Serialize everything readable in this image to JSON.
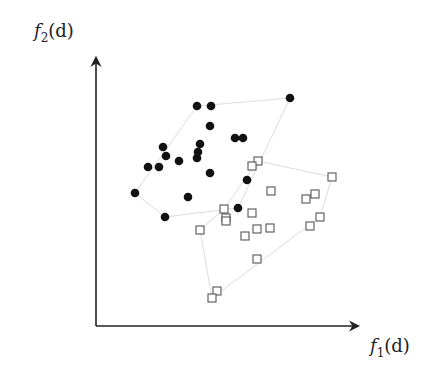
{
  "chart_data": {
    "type": "scatter",
    "title": "",
    "xlabel": "f_1(d)",
    "ylabel": "f_2(d)",
    "axes": {
      "ticks": false,
      "grid": false,
      "arrows": true
    },
    "series": [
      {
        "name": "class A",
        "marker": "filled-circle",
        "color": "#111111",
        "points": [
          [
            197,
            106
          ],
          [
            211,
            106
          ],
          [
            290,
            98
          ],
          [
            210,
            126
          ],
          [
            235,
            138
          ],
          [
            243,
            138
          ],
          [
            163,
            147
          ],
          [
            200,
            144
          ],
          [
            198,
            152
          ],
          [
            197,
            158
          ],
          [
            166,
            156
          ],
          [
            179,
            161
          ],
          [
            148,
            167
          ],
          [
            159,
            167
          ],
          [
            210,
            173
          ],
          [
            247,
            180
          ],
          [
            135,
            193
          ],
          [
            188,
            197
          ],
          [
            165,
            217
          ],
          [
            238,
            208
          ]
        ],
        "hull": [
          [
            135,
            193
          ],
          [
            197,
            106
          ],
          [
            290,
            98
          ],
          [
            238,
            208
          ],
          [
            165,
            217
          ]
        ]
      },
      {
        "name": "class B",
        "marker": "open-square",
        "color": "#555555",
        "points": [
          [
            258,
            161
          ],
          [
            252,
            166
          ],
          [
            271,
            191
          ],
          [
            332,
            177
          ],
          [
            315,
            194
          ],
          [
            306,
            199
          ],
          [
            224,
            209
          ],
          [
            226,
            218
          ],
          [
            226,
            221
          ],
          [
            252,
            213
          ],
          [
            200,
            230
          ],
          [
            245,
            236
          ],
          [
            257,
            229
          ],
          [
            270,
            228
          ],
          [
            320,
            217
          ],
          [
            310,
            226
          ],
          [
            257,
            259
          ],
          [
            217,
            291
          ],
          [
            212,
            298
          ]
        ],
        "hull": [
          [
            224,
            209
          ],
          [
            258,
            161
          ],
          [
            332,
            177
          ],
          [
            320,
            217
          ],
          [
            212,
            298
          ],
          [
            200,
            230
          ]
        ]
      }
    ]
  },
  "labels": {
    "x_name": "f",
    "x_sub": "1",
    "x_arg": "(d)",
    "y_name": "f",
    "y_sub": "2",
    "y_arg": "(d)"
  }
}
